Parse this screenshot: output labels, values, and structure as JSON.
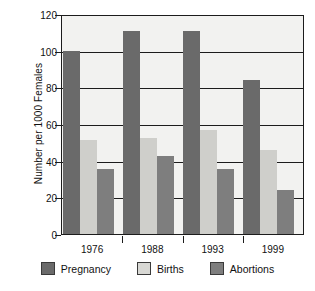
{
  "chart_data": {
    "type": "bar",
    "title": "",
    "xlabel": "",
    "ylabel": "Number per 1000 Females",
    "categories": [
      "1976",
      "1988",
      "1993",
      "1999"
    ],
    "series": [
      {
        "name": "Pregnancy",
        "color": "#6a6a6a",
        "values": [
          101,
          112,
          112,
          85
        ]
      },
      {
        "name": "Births",
        "color": "#d8d8d4",
        "values": [
          52,
          53,
          57,
          46
        ]
      },
      {
        "name": "Abortions",
        "color": "#7e7e7e",
        "values": [
          36,
          43,
          36,
          24
        ]
      }
    ],
    "ylim": [
      0,
      120
    ],
    "yticks": [
      0,
      20,
      40,
      60,
      80,
      100,
      120
    ],
    "ytick_labels": [
      "0",
      "20",
      "40",
      "60",
      "80",
      "100",
      "120"
    ],
    "grid": true,
    "grid_axis": "y",
    "legend_position": "bottom",
    "plot_background": "#f2f2f0",
    "axis_color": "#1c1c1c"
  }
}
